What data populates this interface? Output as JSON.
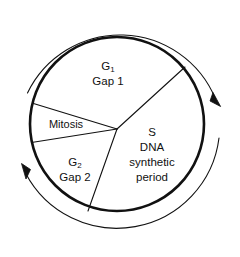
{
  "diagram": {
    "type": "cell-cycle-wheel",
    "colors": {
      "stroke": "#111111",
      "background": "#ffffff",
      "text": "#111111"
    },
    "phases": [
      {
        "id": "g1",
        "symbol": "G",
        "subscript": "1",
        "name": "Gap 1",
        "lines": [
          "G1",
          "Gap 1"
        ]
      },
      {
        "id": "s",
        "symbol": "S",
        "subscript": "",
        "name": "DNA synthetic period",
        "lines": [
          "S",
          "DNA",
          "synthetic",
          "period"
        ]
      },
      {
        "id": "g2",
        "symbol": "G",
        "subscript": "2",
        "name": "Gap 2",
        "lines": [
          "G2",
          "Gap 2"
        ]
      },
      {
        "id": "mitosis",
        "symbol": "",
        "subscript": "",
        "name": "Mitosis",
        "lines": [
          "Mitosis"
        ]
      }
    ],
    "labels": {
      "g1_symbol": "G",
      "g1_subscript": "1",
      "g1_name": "Gap 1",
      "g2_symbol": "G",
      "g2_subscript": "2",
      "g2_name": "Gap 2",
      "s_symbol": "S",
      "s_line2": "DNA",
      "s_line3": "synthetic",
      "s_line4": "period",
      "mitosis_name": "Mitosis"
    },
    "arrows": {
      "direction": "clockwise",
      "count": 2,
      "upper_right": "arrowhead pointing down-right",
      "lower_left": "arrowhead pointing up"
    }
  }
}
